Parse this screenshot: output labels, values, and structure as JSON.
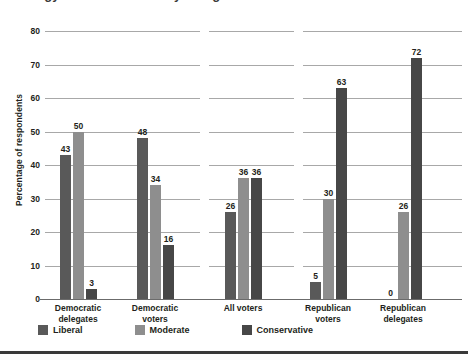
{
  "title_clipped": "Ideology of Voters and Party Delegates in 2008",
  "footer_rule_color": "#3a3a3a",
  "legend": {
    "items": [
      {
        "label": "Liberal",
        "color": "#595959",
        "icon": "legend-swatch"
      },
      {
        "label": "Moderate",
        "color": "#8e8e8e",
        "icon": "legend-swatch"
      },
      {
        "label": "Conservative",
        "color": "#474747",
        "icon": "legend-swatch"
      }
    ]
  },
  "chart_data": {
    "type": "bar",
    "title": "Ideology of Voters and Party Delegates in 2008",
    "xlabel": "",
    "ylabel": "Percentage of respondents",
    "ylim": [
      0,
      80
    ],
    "yticks": [
      0,
      10,
      20,
      30,
      40,
      50,
      60,
      70,
      80
    ],
    "grid": true,
    "legend_position": "bottom-left",
    "categories": [
      "Democratic delegates",
      "Democratic voters",
      "All voters",
      "Republican voters",
      "Republican delegates"
    ],
    "category_lines": [
      [
        "Democratic",
        "delegates"
      ],
      [
        "Democratic",
        "voters"
      ],
      [
        "All voters"
      ],
      [
        "Republican",
        "voters"
      ],
      [
        "Republican",
        "delegates"
      ]
    ],
    "series": [
      {
        "name": "Liberal",
        "color": "#595959",
        "values": [
          43,
          48,
          26,
          5,
          0
        ]
      },
      {
        "name": "Moderate",
        "color": "#8e8e8e",
        "values": [
          50,
          34,
          36,
          30,
          26
        ]
      },
      {
        "name": "Conservative",
        "color": "#474747",
        "values": [
          3,
          16,
          36,
          63,
          72
        ]
      }
    ]
  }
}
